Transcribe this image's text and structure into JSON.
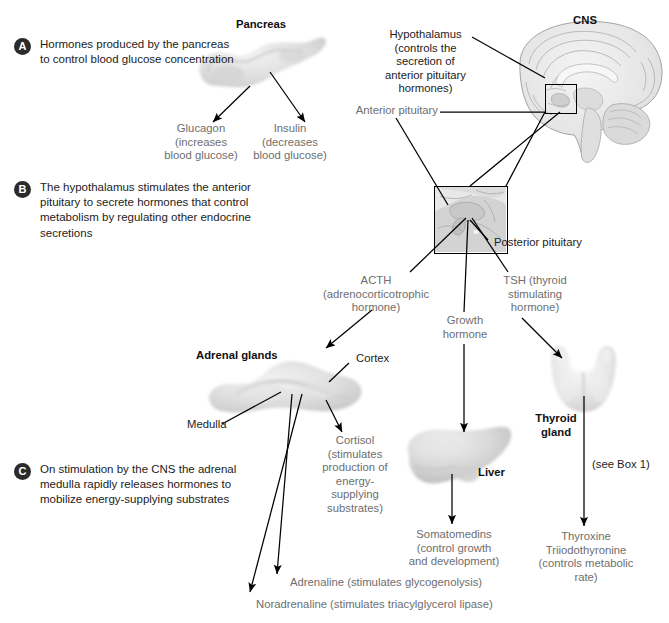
{
  "figure": {
    "title_sections": [
      {
        "key": "A",
        "letter": "A",
        "text": "Hormones produced\nby the pancreas to\ncontrol blood glucose\nconcentration"
      },
      {
        "key": "B",
        "letter": "B",
        "text": "The hypothalamus stimulates the\nanterior pituitary to secrete hormones\nthat control metabolism by\nregulating other endocrine secretions"
      },
      {
        "key": "C",
        "letter": "C",
        "text": "On stimulation by the CNS\nthe adrenal medulla rapidly\nreleases hormones to mobilize\nenergy-supplying substrates"
      }
    ],
    "labels": {
      "pancreas": "Pancreas",
      "cns": "CNS",
      "hypothalamus": "Hypothalamus\n(controls the\nsecretion of\nanterior pituitary\nhormones)",
      "anterior_pituitary": "Anterior pituitary",
      "posterior_pituitary": "Posterior pituitary",
      "glucagon": "Glucagon\n(increases\nblood glucose)",
      "insulin": "Insulin\n(decreases\nblood glucose)",
      "acth": "ACTH\n(adrenocorticotrophic\nhormone)",
      "growth_hormone": "Growth\nhormone",
      "tsh": "TSH (thyroid\nstimulating\nhormone)",
      "adrenal_glands": "Adrenal glands",
      "cortex": "Cortex",
      "medulla": "Medulla",
      "cortisol": "Cortisol\n(stimulates\nproduction of\nenergy-supplying\nsubstrates)",
      "liver": "Liver",
      "somatomedins": "Somatomedins\n(control growth\nand development)",
      "thyroid_gland": "Thyroid\ngland",
      "see_box": "(see Box 1)",
      "thyroxine": "Thyroxine\nTriiodothyronine\n(controls metabolic\nrate)",
      "adrenaline": "Adrenaline (stimulates glycogenolysis)",
      "noradrenaline": "Noradrenaline (stimulates triacylglycerol lipase)"
    },
    "colors": {
      "text_dark": "#1c1c1c",
      "text_gray": "#6e6e6e",
      "badge_fill": "#2b2b2b",
      "line": "#000000",
      "organ_light": "#dcdcdc",
      "organ_mid": "#c4c4c4",
      "background": "#ffffff"
    }
  }
}
